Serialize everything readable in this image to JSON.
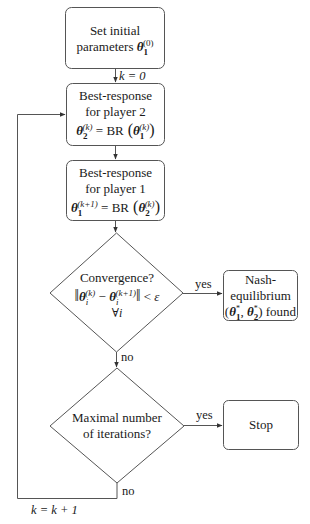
{
  "nodes": {
    "init": {
      "type": "process",
      "line1": "Set initial",
      "line2": "parameters",
      "math": "θ₁⁽⁰⁾"
    },
    "br2": {
      "type": "process",
      "line1": "Best-response",
      "line2": "for player 2",
      "math": "θ₂⁽ᵏ⁾ = BR(θ₁⁽ᵏ⁾)"
    },
    "br1": {
      "type": "process",
      "line1": "Best-response",
      "line2": "for player 1",
      "math": "θ₁⁽ᵏ⁺¹⁾ = BR(θ₂⁽ᵏ⁾)"
    },
    "convergence": {
      "type": "decision",
      "line1": "Convergence?",
      "math": "‖θᵢ⁽ᵏ⁾ − θᵢ⁽ᵏ⁺¹⁾‖ < ε",
      "line3": "∀i"
    },
    "nash": {
      "type": "terminal",
      "line1": "Nash-",
      "line2": "equilibrium",
      "line3": "(θ₁*, θ₂*) found"
    },
    "maxiter": {
      "type": "decision",
      "line1": "Maximal number",
      "line2": "of iterations?"
    },
    "stop": {
      "type": "terminal",
      "label": "Stop"
    }
  },
  "edges": {
    "init_to_br2": "k = 0",
    "conv_yes": "yes",
    "conv_no": "no",
    "max_yes": "yes",
    "max_no": "no",
    "loop_back": "k = k + 1"
  },
  "colors": {
    "stroke": "#555555",
    "text": "#1a1a1a",
    "background": "#ffffff"
  }
}
